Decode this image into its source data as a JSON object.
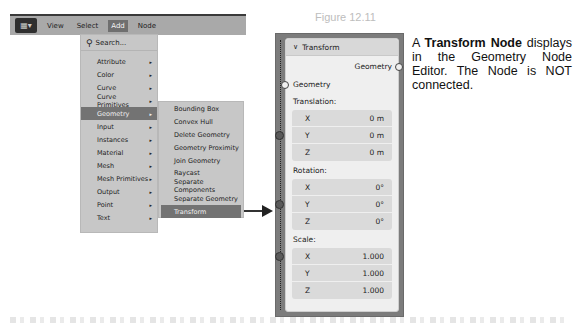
{
  "figure": {
    "label": "Figure 12.11"
  },
  "header": {
    "editor_icon": "node-editor-icon",
    "menus": [
      {
        "label": "View"
      },
      {
        "label": "Select"
      },
      {
        "label": "Add",
        "active": true
      },
      {
        "label": "Node"
      }
    ]
  },
  "add_menu": {
    "search_label": "Search...",
    "categories": [
      {
        "label": "Attribute"
      },
      {
        "label": "Color"
      },
      {
        "label": "Curve"
      },
      {
        "label": "Curve Primitives"
      },
      {
        "label": "Geometry",
        "active": true
      },
      {
        "label": "Input"
      },
      {
        "label": "Instances"
      },
      {
        "label": "Material"
      },
      {
        "label": "Mesh"
      },
      {
        "label": "Mesh Primitives"
      },
      {
        "label": "Output"
      },
      {
        "label": "Point"
      },
      {
        "label": "Text"
      }
    ],
    "submenu_arrow": "▸"
  },
  "geometry_submenu": {
    "items": [
      {
        "label": "Bounding Box"
      },
      {
        "label": "Convex Hull"
      },
      {
        "label": "Delete Geometry"
      },
      {
        "label": "Geometry Proximity"
      },
      {
        "label": "Join Geometry"
      },
      {
        "label": "Raycast"
      },
      {
        "label": "Separate Components"
      },
      {
        "label": "Separate Geometry"
      },
      {
        "label": "Transform",
        "active": true
      }
    ]
  },
  "node": {
    "title": "Transform",
    "collapse_glyph": "∨",
    "output_socket": "Geometry",
    "input_socket": "Geometry",
    "translation": {
      "label": "Translation:",
      "rows": [
        {
          "axis": "X",
          "value": "0 m"
        },
        {
          "axis": "Y",
          "value": "0 m"
        },
        {
          "axis": "Z",
          "value": "0 m"
        }
      ]
    },
    "rotation": {
      "label": "Rotation:",
      "rows": [
        {
          "axis": "X",
          "value": "0°"
        },
        {
          "axis": "Y",
          "value": "0°"
        },
        {
          "axis": "Z",
          "value": "0°"
        }
      ]
    },
    "scale": {
      "label": "Scale:",
      "rows": [
        {
          "axis": "X",
          "value": "1.000"
        },
        {
          "axis": "Y",
          "value": "1.000"
        },
        {
          "axis": "Z",
          "value": "1.000"
        }
      ]
    }
  },
  "description": {
    "prefix": "A ",
    "bold": "Transform Node",
    "suffix": " displays in the Geometry Node Editor. The Node is NOT connected."
  }
}
